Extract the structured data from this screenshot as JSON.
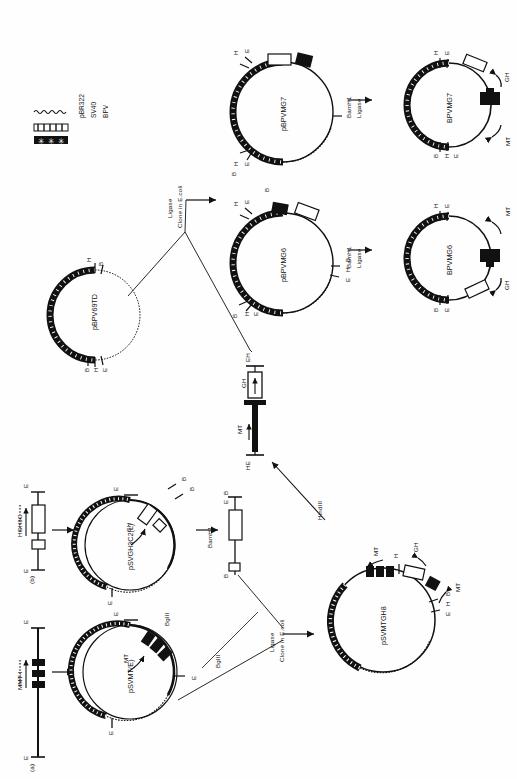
{
  "figure": {
    "type": "plasmid-construction-diagram",
    "orientation": "rotated-90-counterclockwise",
    "legend": {
      "items": [
        {
          "label": "pBR322",
          "pattern": "wavy-thin-line"
        },
        {
          "label": "SV40",
          "pattern": "hatched-open-box"
        },
        {
          "label": "BPV",
          "pattern": "solid-black-box"
        }
      ]
    },
    "panels": [
      {
        "id": "a",
        "label": "(a)",
        "gene_label": "MMT-I",
        "ends": [
          "E",
          "E"
        ],
        "elements": "three solid black boxes with rightward arrow"
      },
      {
        "id": "b",
        "label": "(b)",
        "gene_label": "HGH3C",
        "ends": [
          "E",
          "E"
        ],
        "elements": "two open boxes with rightward arrow"
      }
    ],
    "plasmids": [
      {
        "name": "pBPV69TD",
        "sites": [
          "H",
          "B",
          "B",
          "H",
          "E"
        ]
      },
      {
        "name": "pBPVMG6",
        "sites": [
          "H",
          "E",
          "B",
          "B",
          "H",
          "E",
          "B",
          "H",
          "E"
        ]
      },
      {
        "name": "pBPVMG7",
        "sites": [
          "H",
          "E",
          "B",
          "H",
          "E",
          "B"
        ]
      },
      {
        "name": "BPVMG6",
        "sites": [
          "H",
          "E",
          "B",
          "H",
          "E"
        ],
        "arrows": [
          "MT",
          "GH"
        ]
      },
      {
        "name": "BPVMG7",
        "sites": [
          "H",
          "E",
          "B",
          "H",
          "E"
        ],
        "arrows": [
          "GH",
          "MT"
        ]
      },
      {
        "name": "pSVMT(E)",
        "sites": [
          "E",
          "E",
          "E"
        ],
        "arrows": [
          "MT"
        ],
        "cut": "BglII"
      },
      {
        "name": "pSVGH3C2(L)",
        "sites": [
          "E",
          "B",
          "B",
          "E",
          "E"
        ],
        "arrows": [
          "GH"
        ]
      },
      {
        "name": "pSVMTGH8",
        "sites": [
          "H",
          "B",
          "H",
          "E"
        ],
        "arrows": [
          "MT",
          "GH",
          "MT"
        ]
      }
    ],
    "fragments": [
      {
        "id": "mt-gh-fragment",
        "left_end": "HE",
        "right_end": "EH",
        "arrows": [
          "MT",
          "GH"
        ]
      },
      {
        "id": "bamh1-fragment",
        "left_end": "B",
        "right_end": "E B",
        "enzyme": "BamH1"
      }
    ],
    "steps": [
      {
        "id": "step-ligase-clone-top",
        "lines": [
          "Ligase",
          "Clone in E.coli"
        ]
      },
      {
        "id": "step-bamh1-ligase-mg7",
        "lines": [
          "BamH1",
          "Ligase"
        ]
      },
      {
        "id": "step-bamh1-ligase-mg6",
        "lines": [
          "BamH1",
          "Ligase"
        ]
      },
      {
        "id": "step-bamh1-frag",
        "lines": [
          "BamH1"
        ]
      },
      {
        "id": "step-ligase-clone-bottom",
        "lines": [
          "Ligase",
          "Clone in E.coli"
        ]
      },
      {
        "id": "step-hindiii",
        "lines": [
          "HindIII"
        ]
      },
      {
        "id": "step-bglii",
        "lines": [
          "BglII"
        ]
      }
    ],
    "site_letters": {
      "H": "HindIII site",
      "B": "BamHI site",
      "E": "EcoRI site"
    },
    "gene_arrows": {
      "MT": "metallothionein promoter",
      "GH": "growth hormone gene"
    }
  }
}
